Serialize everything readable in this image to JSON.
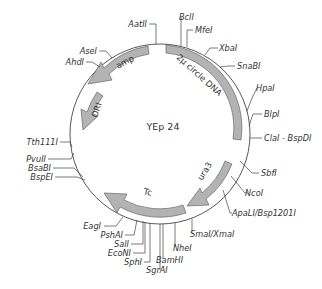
{
  "plasmid": {
    "name": "YEp 24",
    "features": [
      {
        "id": "amp",
        "label": "amp"
      },
      {
        "id": "ori",
        "label": "ORI"
      },
      {
        "id": "two-micron",
        "label": "2µ circle DNA"
      },
      {
        "id": "ura3",
        "label": "ura3"
      },
      {
        "id": "tc",
        "label": "Tc"
      }
    ],
    "sites": {
      "aatII": "AatII",
      "bclI": "BclI",
      "mfeI": "MfeI",
      "xbaI": "XbaI",
      "snaBI": "SnaBI",
      "aseI": "AseI",
      "ahdI": "AhdI",
      "hpaI": "HpaI",
      "blpI": "BlpI",
      "claI": "ClaI - BspDI",
      "tth111I": "Tth111I",
      "sbfI": "SbfI",
      "pvuII": "PvuII",
      "bsaBI": "BsaBI",
      "bspEI": "BspEI",
      "ncoI": "NcoI",
      "apaLI": "ApaLI/Bsp1201I",
      "smaI": "SmaI/XmaI",
      "eagI": "EagI",
      "nheI": "NheI",
      "pshAI": "PshAI",
      "salI": "SalI",
      "bamHI": "BamHI",
      "ecoNI": "EcoNI",
      "sgrAI": "SgrAI",
      "sphI": "SphI"
    }
  },
  "colors": {
    "feature_fill": "#b3b3b3",
    "line": "#444444"
  }
}
